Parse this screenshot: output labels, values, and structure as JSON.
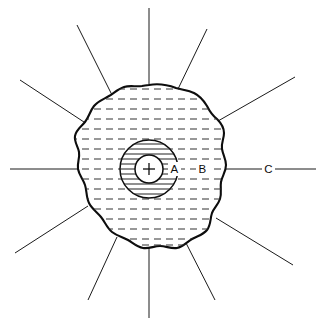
{
  "figure": {
    "center_marker": "+",
    "background_color": "#ffffff",
    "line_color": "#1a1a1a",
    "outline_color": "#0d0d0d"
  },
  "labels": {
    "zone_a": "A",
    "zone_b": "B",
    "zone_c": "C"
  },
  "zones": [
    {
      "id": "A",
      "label": "A",
      "hatching": "solid",
      "description": "inner circular zone with solid horizontal hatching"
    },
    {
      "id": "B",
      "label": "B",
      "hatching": "dashed",
      "description": "outer irregular blob zone with dashed horizontal hatching"
    },
    {
      "id": "C",
      "label": "C",
      "hatching": "none",
      "description": "region outside the blob along the radiating lines"
    }
  ],
  "geometry": {
    "center": {
      "x": 149,
      "y": 169
    },
    "core_circle_radius": 14,
    "zone_a_circle_radius": 29,
    "ray_count": 12,
    "hatch_spacing": 10
  }
}
